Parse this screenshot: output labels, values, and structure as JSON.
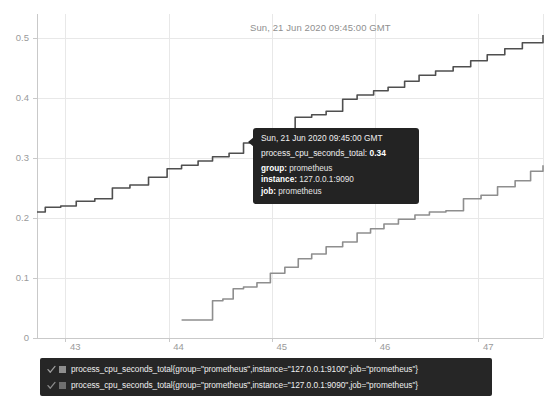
{
  "header": {
    "timestamp": "Sun, 21 Jun 2020 09:45:00 GMT"
  },
  "tooltip": {
    "time": "Sun, 21 Jun 2020 09:45:00 GMT",
    "metric_name": "process_cpu_seconds_total:",
    "metric_value": "0.34",
    "rows": [
      {
        "key": "group:",
        "value": "prometheus"
      },
      {
        "key": "instance:",
        "value": "127.0.0.1:9090"
      },
      {
        "key": "job:",
        "value": "prometheus"
      }
    ]
  },
  "legend": {
    "items": [
      {
        "label": "process_cpu_seconds_total{group=\"prometheus\",instance=\"127.0.0.1:9100\",job=\"prometheus\"}",
        "color": "#8e8e8e",
        "checked": true,
        "check_icon": "check-icon"
      },
      {
        "label": "process_cpu_seconds_total{group=\"prometheus\",instance=\"127.0.0.1:9090\",job=\"prometheus\"}",
        "color": "#6e6e6e",
        "checked": true,
        "check_icon": "check-icon"
      }
    ]
  },
  "chart_data": {
    "type": "line",
    "title": "",
    "subtitle": "",
    "xlabel": "",
    "ylabel": "",
    "grid": true,
    "legend_position": "bottom",
    "xlim": [
      42.72,
      47.62
    ],
    "ylim": [
      0,
      0.54
    ],
    "xticks": [
      43,
      44,
      45,
      46,
      47
    ],
    "xtick_labels": [
      "43",
      "44",
      "45",
      "46",
      "47"
    ],
    "yticks": [
      0,
      0.1,
      0.2,
      0.3,
      0.4,
      0.5
    ],
    "ytick_labels": [
      "0",
      "0.1",
      "0.2",
      "0.3",
      "0.4",
      "0.5"
    ],
    "step_style": "post",
    "hover_point": {
      "x": 44.95,
      "y": 0.34,
      "label": "0.34"
    },
    "series": [
      {
        "name": "process_cpu_seconds_total{group=\"prometheus\",instance=\"127.0.0.1:9090\",job=\"prometheus\"}",
        "color": "#4f4f4f",
        "x": [
          42.72,
          42.8,
          42.95,
          43.1,
          43.28,
          43.45,
          43.62,
          43.8,
          43.98,
          44.12,
          44.28,
          44.42,
          44.58,
          44.72,
          44.88,
          44.95,
          45.08,
          45.22,
          45.38,
          45.52,
          45.68,
          45.82,
          45.98,
          46.12,
          46.28,
          46.42,
          46.58,
          46.75,
          46.92,
          47.08,
          47.25,
          47.42,
          47.62
        ],
        "y": [
          0.21,
          0.218,
          0.22,
          0.228,
          0.232,
          0.25,
          0.255,
          0.268,
          0.282,
          0.288,
          0.295,
          0.302,
          0.308,
          0.325,
          0.332,
          0.34,
          0.348,
          0.368,
          0.372,
          0.378,
          0.398,
          0.405,
          0.412,
          0.418,
          0.428,
          0.438,
          0.445,
          0.452,
          0.462,
          0.472,
          0.482,
          0.492,
          0.505
        ]
      },
      {
        "name": "process_cpu_seconds_total{group=\"prometheus\",instance=\"127.0.0.1:9100\",job=\"prometheus\"}",
        "color": "#8e8e8e",
        "x": [
          44.12,
          44.28,
          44.42,
          44.52,
          44.62,
          44.72,
          44.85,
          44.98,
          45.12,
          45.25,
          45.38,
          45.52,
          45.68,
          45.82,
          45.95,
          46.08,
          46.22,
          46.38,
          46.52,
          46.68,
          46.85,
          47.02,
          47.18,
          47.35,
          47.5,
          47.62
        ],
        "y": [
          0.03,
          0.03,
          0.062,
          0.065,
          0.082,
          0.085,
          0.092,
          0.108,
          0.118,
          0.132,
          0.14,
          0.152,
          0.16,
          0.175,
          0.182,
          0.19,
          0.198,
          0.205,
          0.21,
          0.212,
          0.232,
          0.238,
          0.252,
          0.262,
          0.278,
          0.288
        ]
      }
    ]
  }
}
